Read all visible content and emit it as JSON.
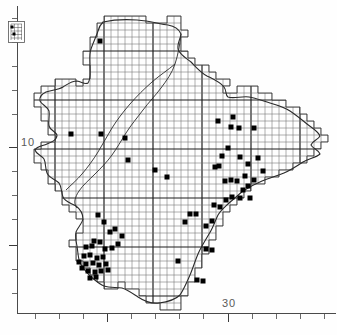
{
  "figure": {
    "type": "distribution-map"
  },
  "axes": {
    "y_label": "10",
    "x_label": "30",
    "y_label_x": 21,
    "y_label_y": 136,
    "x_label_x": 222,
    "x_label_y": 297,
    "y_ticks": [
      18,
      42,
      66,
      90,
      114,
      147,
      171,
      195,
      219,
      245,
      269,
      293
    ],
    "y_major_ticks": [
      147,
      245
    ],
    "x_ticks": [
      35,
      59,
      83,
      107,
      131,
      155,
      179,
      203,
      228,
      252,
      276,
      300,
      324
    ],
    "x_major_ticks": [
      107,
      228
    ]
  },
  "grid": {
    "cell_size": 7,
    "major_every": 7,
    "minor_color": "#6e6e6e",
    "major_color": "#1f1f1f"
  },
  "colors": {
    "background": "#ffffff",
    "coastline": "#2b2b2b",
    "grid_minor": "#707070",
    "grid_major": "#202020",
    "record_dot": "#000000",
    "axis": "#4a4a4a",
    "label_text": "#5a5a5a"
  },
  "inset": {
    "name": "island-inset",
    "x": 8,
    "y": 21,
    "width": 17,
    "height": 22,
    "dots": [
      [
        4,
        6
      ],
      [
        6,
        13
      ]
    ]
  },
  "records": {
    "symbol": "filled-square",
    "size": 5,
    "count": 71,
    "points": [
      [
        100,
        41
      ],
      [
        71,
        134
      ],
      [
        101,
        134
      ],
      [
        125,
        138
      ],
      [
        128,
        160
      ],
      [
        155,
        170
      ],
      [
        167,
        177
      ],
      [
        231,
        127
      ],
      [
        239,
        128
      ],
      [
        254,
        128
      ],
      [
        233,
        117
      ],
      [
        218,
        121
      ],
      [
        228,
        148
      ],
      [
        222,
        156
      ],
      [
        240,
        157
      ],
      [
        219,
        166
      ],
      [
        215,
        167
      ],
      [
        248,
        164
      ],
      [
        258,
        158
      ],
      [
        263,
        171
      ],
      [
        245,
        176
      ],
      [
        225,
        181
      ],
      [
        231,
        180
      ],
      [
        237,
        181
      ],
      [
        248,
        186
      ],
      [
        254,
        180
      ],
      [
        232,
        197
      ],
      [
        226,
        200
      ],
      [
        240,
        198
      ],
      [
        243,
        190
      ],
      [
        250,
        198
      ],
      [
        190,
        214
      ],
      [
        196,
        214
      ],
      [
        212,
        221
      ],
      [
        185,
        222
      ],
      [
        206,
        226
      ],
      [
        214,
        205
      ],
      [
        220,
        207
      ],
      [
        206,
        249
      ],
      [
        212,
        250
      ],
      [
        178,
        261
      ],
      [
        197,
        280
      ],
      [
        203,
        281
      ],
      [
        98,
        215
      ],
      [
        104,
        222
      ],
      [
        110,
        232
      ],
      [
        94,
        241
      ],
      [
        100,
        242
      ],
      [
        86,
        247
      ],
      [
        92,
        246
      ],
      [
        105,
        249
      ],
      [
        112,
        248
      ],
      [
        84,
        256
      ],
      [
        90,
        255
      ],
      [
        97,
        258
      ],
      [
        103,
        257
      ],
      [
        86,
        264
      ],
      [
        93,
        263
      ],
      [
        99,
        265
      ],
      [
        106,
        264
      ],
      [
        88,
        271
      ],
      [
        95,
        272
      ],
      [
        101,
        271
      ],
      [
        108,
        270
      ],
      [
        90,
        278
      ],
      [
        96,
        277
      ],
      [
        82,
        268
      ],
      [
        79,
        262
      ],
      [
        118,
        244
      ],
      [
        122,
        236
      ],
      [
        115,
        229
      ]
    ]
  }
}
